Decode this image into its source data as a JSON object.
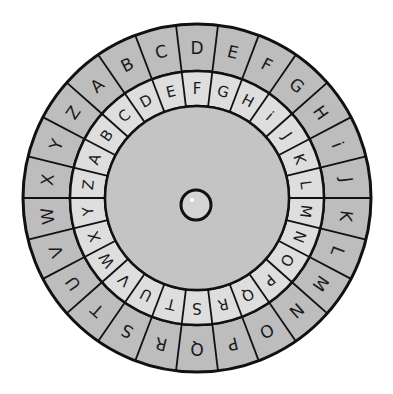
{
  "colors": {
    "outer_ring": "#bdbdbd",
    "inner_ring": "#dedede",
    "center_disc": "#c4c4c4",
    "line": "#111111",
    "background": "#ffffff"
  },
  "outer_ring": {
    "letters": [
      "A",
      "B",
      "C",
      "D",
      "E",
      "F",
      "G",
      "H",
      "i",
      "J",
      "K",
      "L",
      "M",
      "N",
      "O",
      "P",
      "Q",
      "R",
      "S",
      "T",
      "U",
      "V",
      "W",
      "X",
      "Y",
      "Z"
    ],
    "start_letter": "D",
    "start_angle_deg": -90
  },
  "inner_ring": {
    "letters": [
      "A",
      "B",
      "C",
      "D",
      "E",
      "F",
      "G",
      "H",
      "i",
      "J",
      "K",
      "L",
      "M",
      "N",
      "O",
      "P",
      "Q",
      "R",
      "S",
      "T",
      "U",
      "V",
      "W",
      "X",
      "Y",
      "Z"
    ],
    "start_letter": "F",
    "start_angle_deg": -90
  },
  "center": {
    "pin": "rivet"
  }
}
